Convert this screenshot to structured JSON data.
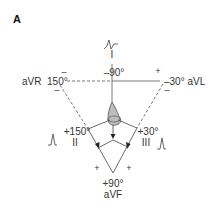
{
  "panel_label": "A",
  "leads": {
    "I": {
      "name": "I",
      "angle": "–90°"
    },
    "aVR": {
      "name": "aVR",
      "angle": "150°",
      "full": "aVR  150°"
    },
    "aVL": {
      "name": "aVL",
      "angle": "–30°",
      "full": "–30° aVL"
    },
    "II": {
      "name": "II",
      "angle": "+150°"
    },
    "III": {
      "name": "III",
      "angle": "+30°"
    },
    "aVF": {
      "name": "aVF",
      "angle": "+90°"
    }
  },
  "signs": {
    "top_left": "–",
    "top_right": "+",
    "aVR_lower": "–",
    "aVL_lower": "–",
    "bottom_left": "+",
    "bottom_right": "+"
  },
  "icons": {
    "lead_I_waveform": "biphasic-complex",
    "lead_II_waveform": "upright-complex",
    "lead_III_waveform": "upright-complex",
    "heart": "heart-shape"
  },
  "colors": {
    "line": "#444444",
    "heart_fill": "#b8b8b8",
    "text": "#333333"
  }
}
